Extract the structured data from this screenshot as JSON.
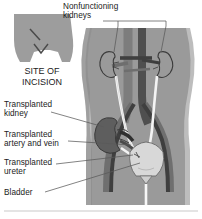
{
  "figure": {
    "type": "medical-anatomical-illustration"
  },
  "inset": {
    "caption": "SITE OF\nINCISION",
    "description": "Front view of lower torso and pelvis showing incision marks"
  },
  "labels": {
    "nonfunctioning_kidneys": "Nonfunctioning\nkidneys",
    "transplanted_kidney": "Transplanted\nkidney",
    "transplanted_artery_and_vein": "Transplanted\nartery and vein",
    "transplanted_ureter": "Transplanted\nureter",
    "bladder": "Bladder"
  },
  "structures": [
    {
      "name": "native-kidney-left",
      "label": "Nonfunctioning kidney (left)"
    },
    {
      "name": "native-kidney-right",
      "label": "Nonfunctioning kidney (right)"
    },
    {
      "name": "transplanted-kidney",
      "label": "Transplanted kidney"
    },
    {
      "name": "aorta",
      "label": "Abdominal aorta"
    },
    {
      "name": "vena-cava",
      "label": "Inferior vena cava"
    },
    {
      "name": "iliac-vessels",
      "label": "Iliac artery and vein"
    },
    {
      "name": "native-ureter-left",
      "label": "Native ureter (left)"
    },
    {
      "name": "native-ureter-right",
      "label": "Native ureter (right)"
    },
    {
      "name": "transplanted-ureter",
      "label": "Transplanted ureter"
    },
    {
      "name": "bladder",
      "label": "Bladder"
    },
    {
      "name": "urethra",
      "label": "Urethra"
    }
  ],
  "colors": {
    "background": "#ffffff",
    "body_fill": "#9a9a9a",
    "body_fill_light": "#b3b3b3",
    "inset_fill": "#9d9d9d",
    "aorta": "#4f4f4f",
    "vena_cava": "#7d7d7d",
    "transplanted_kidney": "#5e5e5e",
    "native_kidney_outline": "#3a3a3a",
    "bladder": "#d8d8d8",
    "ureter": "#f4f4f4",
    "outline": "#3c3c3c",
    "text": "#1b1b1b",
    "leader_line": "#5a5a5a",
    "divider": "#c9c9c9"
  }
}
